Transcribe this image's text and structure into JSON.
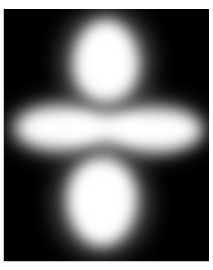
{
  "image": {
    "subject": "d_z2 orbital density render",
    "background_color": "#000000",
    "border_color": "#ffffff",
    "glow_color": "#ffffff",
    "parts": [
      {
        "name": "upper-lobe"
      },
      {
        "name": "equatorial-torus"
      },
      {
        "name": "lower-lobe"
      }
    ]
  }
}
